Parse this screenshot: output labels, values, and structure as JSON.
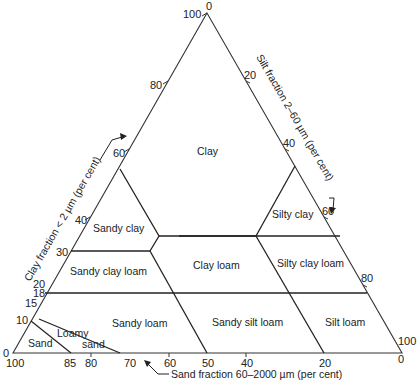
{
  "diagram": {
    "type": "ternary soil texture triangle",
    "axes": {
      "clay": {
        "title": "Clay fraction < 2 µm (per cent)",
        "ticks": [
          "0",
          "10",
          "15",
          "18",
          "20",
          "30",
          "40",
          "60",
          "80",
          "100"
        ]
      },
      "silt": {
        "title": "Silt fraction 2–60 µm (per cent)",
        "ticks": [
          "0",
          "20",
          "40",
          "60",
          "80",
          "100"
        ]
      },
      "sand": {
        "title": "Sand fraction 60–2000 µm (per cent)",
        "ticks": [
          "100",
          "85",
          "80",
          "70",
          "60",
          "50",
          "40",
          "20",
          "0"
        ]
      }
    },
    "regions": [
      {
        "name": "Clay"
      },
      {
        "name": "Sandy clay"
      },
      {
        "name": "Silty clay"
      },
      {
        "name": "Sandy clay loam"
      },
      {
        "name": "Clay loam"
      },
      {
        "name": "Silty clay loam"
      },
      {
        "name": "Sandy loam"
      },
      {
        "name": "Sandy silt loam"
      },
      {
        "name": "Silt loam"
      },
      {
        "name": "Loamy sand",
        "line1": "Loamy",
        "line2": "sand"
      },
      {
        "name": "Sand"
      }
    ]
  }
}
